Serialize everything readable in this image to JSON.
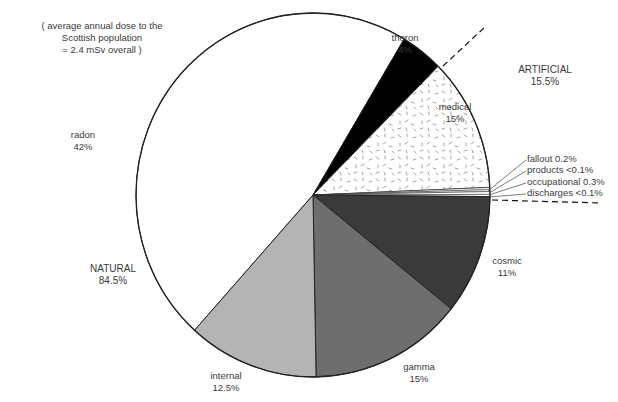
{
  "note": {
    "line1": "( average annual dose to the",
    "line2": "Scottish population",
    "line3": "= 2.4 mSv overall )"
  },
  "groups": {
    "natural": {
      "label": "NATURAL",
      "value": "84.5%"
    },
    "artificial": {
      "label": "ARTIFICIAL",
      "value": "15.5%"
    }
  },
  "slices": {
    "radon": {
      "label": "radon",
      "value": "42%"
    },
    "thoron": {
      "label": "thoron",
      "value": "4%"
    },
    "medical": {
      "label": "medical",
      "value": "15%"
    },
    "fallout": {
      "label": "fallout 0.2%"
    },
    "products": {
      "label": "products <0.1%"
    },
    "occupational": {
      "label": "occupational 0.3%"
    },
    "discharges": {
      "label": "discharges <0.1%"
    },
    "cosmic": {
      "label": "cosmic",
      "value": "11%"
    },
    "gamma": {
      "label": "gamma",
      "value": "15%"
    },
    "internal": {
      "label": "internal",
      "value": "12.5%"
    }
  },
  "colors": {
    "radon": "#ffffff",
    "thoron": "#000000",
    "medical": "#ffffff",
    "cosmic": "#3a3a3a",
    "gamma": "#6e6e6e",
    "internal": "#b4b4b4",
    "outline": "#222222"
  },
  "chart_data": {
    "type": "pie",
    "title": "",
    "subtitle": "( average annual dose to the Scottish population = 2.4 mSv overall )",
    "categories": [
      "radon",
      "thoron",
      "medical",
      "fallout",
      "products",
      "occupational",
      "discharges",
      "cosmic",
      "gamma",
      "internal"
    ],
    "values": [
      42,
      4,
      15,
      0.2,
      0.1,
      0.3,
      0.1,
      11,
      15,
      12.5
    ],
    "value_labels": [
      "42%",
      "4%",
      "15%",
      "0.2%",
      "<0.1%",
      "0.3%",
      "<0.1%",
      "11%",
      "15%",
      "12.5%"
    ],
    "groups": [
      {
        "name": "NATURAL",
        "total": 84.5,
        "members": [
          "radon",
          "thoron",
          "cosmic",
          "gamma",
          "internal"
        ]
      },
      {
        "name": "ARTIFICIAL",
        "total": 15.5,
        "members": [
          "medical",
          "fallout",
          "products",
          "occupational",
          "discharges"
        ]
      }
    ],
    "unit": "% of annual dose",
    "overall_dose": "2.4 mSv",
    "legend": "none (direct labels)"
  }
}
